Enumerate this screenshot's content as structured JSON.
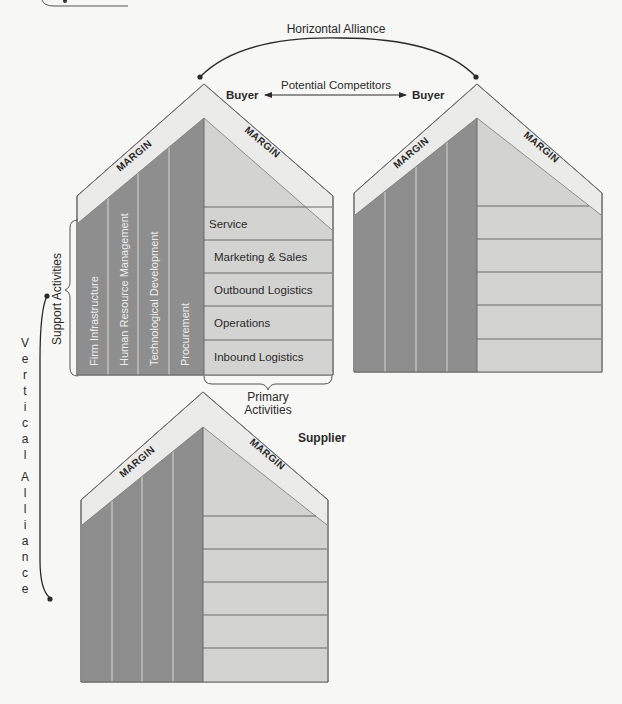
{
  "diagram": {
    "colors": {
      "background": "#f7f7f5",
      "margin_band": "#ebebea",
      "support_area": "#8e8e8e",
      "primary_area": "#d3d3d2",
      "outline": "#5a5a5a",
      "column_divider": "#d8d8d8",
      "connector": "#2a2a2a"
    },
    "top_strip": {
      "visible": true
    },
    "horizontal_alliance": {
      "label": "Horizontal Alliance"
    },
    "potential_competitors": {
      "label": "Potential Competitors"
    },
    "vertical_alliance": {
      "label": "Vertical Alliance",
      "chars": [
        "V",
        "e",
        "r",
        "t",
        "i",
        "c",
        "a",
        "l",
        "A",
        "l",
        "l",
        "i",
        "a",
        "n",
        "c",
        "e"
      ]
    },
    "houses": [
      {
        "id": "buyer-left",
        "role_label": "Buyer",
        "margin_left": "MARGIN",
        "margin_right": "MARGIN",
        "support_activities": [
          "Firm Infrastructure",
          "Human Resource Management",
          "Technological Development",
          "Procurement"
        ],
        "primary_activities": [
          "Service",
          "Marketing & Sales",
          "Outbound Logistics",
          "Operations",
          "Inbound Logistics"
        ],
        "support_group_label": "Support Activities",
        "primary_group_label_line1": "Primary",
        "primary_group_label_line2": "Activities"
      },
      {
        "id": "buyer-right",
        "role_label": "Buyer",
        "margin_left": "MARGIN",
        "margin_right": "MARGIN",
        "support_activities": [
          "",
          "",
          "",
          ""
        ],
        "primary_activities": [
          "",
          "",
          "",
          "",
          ""
        ]
      },
      {
        "id": "supplier",
        "role_label": "Supplier",
        "margin_left": "MARGIN",
        "margin_right": "MARGIN",
        "support_activities": [
          "",
          "",
          "",
          ""
        ],
        "primary_activities": [
          "",
          "",
          "",
          "",
          ""
        ]
      }
    ]
  }
}
